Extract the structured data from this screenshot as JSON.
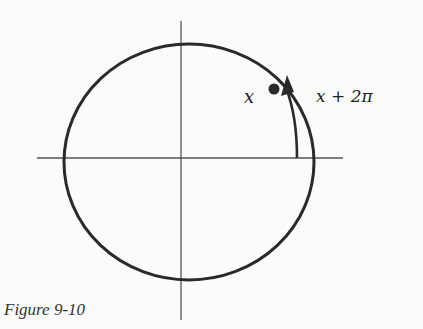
{
  "figure": {
    "caption": "Figure 9-10",
    "labels": {
      "point": "x",
      "wrapped": "x + 2π"
    },
    "colors": {
      "ink": "#2a2a2a",
      "axis": "#555555",
      "background": "#fbfbf9"
    },
    "elements": [
      "unit circle",
      "x-axis",
      "y-axis",
      "point x on circle",
      "arrow arc from positive x-axis to x labeled x + 2π"
    ]
  }
}
